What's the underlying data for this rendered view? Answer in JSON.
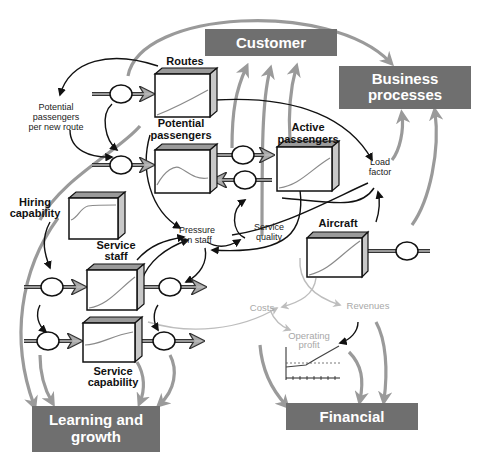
{
  "perspectives": {
    "customer": {
      "label": "Customer"
    },
    "business_processes": {
      "label_line1": "Business",
      "label_line2": "processes"
    },
    "learning_growth": {
      "label_line1": "Learning and",
      "label_line2": "growth"
    },
    "financial": {
      "label": "Financial"
    }
  },
  "stocks": {
    "routes": {
      "label": "Routes"
    },
    "potential_passengers": {
      "label_line1": "Potential",
      "label_line2": "passengers"
    },
    "active_passengers": {
      "label_line1": "Active",
      "label_line2": "passengers"
    },
    "hiring_capability": {
      "label_line1": "Hiring",
      "label_line2": "capability"
    },
    "service_staff": {
      "label_line1": "Service",
      "label_line2": "staff"
    },
    "service_capability": {
      "label_line1": "Service",
      "label_line2": "capability"
    },
    "aircraft": {
      "label": "Aircraft"
    }
  },
  "variables": {
    "potential_per_route": {
      "line1": "Potential",
      "line2": "passengers",
      "line3": "per new route"
    },
    "load_factor": {
      "line1": "Load",
      "line2": "factor"
    },
    "pressure_on_staff": {
      "line1": "Pressure",
      "line2": "on staff"
    },
    "service_quality": {
      "line1": "Service",
      "line2": "quality"
    }
  },
  "financial_vars": {
    "costs": "Costs",
    "revenues": "Revenues",
    "operating_profit_line1": "Operating",
    "operating_profit_line2": "profit"
  },
  "colors": {
    "perspective_box": "#6f6f6f",
    "grey_link": "#9a9a9a",
    "financial_text": "#a8a8a8",
    "black_link": "#111111"
  }
}
